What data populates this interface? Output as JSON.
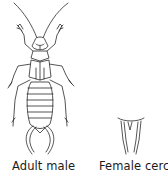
{
  "figure": {
    "panels": [
      {
        "id": "adult-male",
        "label": "Adult male"
      },
      {
        "id": "female-cerci",
        "label": "Female cerci"
      }
    ]
  },
  "colors": {
    "ink": "#2a2a2a",
    "background": "#ffffff"
  }
}
